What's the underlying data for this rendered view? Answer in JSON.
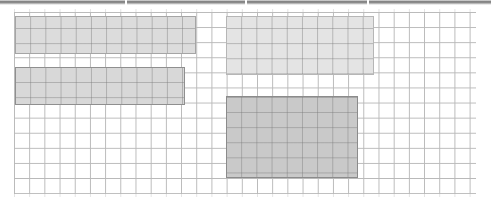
{
  "window": {
    "width": 491,
    "height": 207,
    "background_color": "#ffffff"
  },
  "toolbar_strip": {
    "name": "cropped-toolbar-strip",
    "description": "bottom edge of a cropped toolbar above the canvas",
    "edge_color": "#7c7c7c",
    "divider_positions": [
      125,
      245,
      367
    ]
  },
  "canvas": {
    "name": "grid-canvas",
    "grid_line_color": "#b9b9b9",
    "cell_width": 15.2,
    "cell_height": 15.1,
    "columns": 30,
    "rows": 12,
    "left": 14,
    "top": 12,
    "width": 462,
    "height": 182
  },
  "blocks": [
    {
      "id": "top-left",
      "label": "top-left-block",
      "fill_color": "#dcdcdc",
      "border_color": "#a5a5a5",
      "x": 15,
      "y": 16,
      "width": 181,
      "height": 38,
      "cells_wide": 12,
      "cells_tall": 3
    },
    {
      "id": "bottom-left",
      "label": "bottom-left-block",
      "fill_color": "#d8d8d8",
      "border_color": "#8f8f8f",
      "x": 15,
      "y": 67,
      "width": 170,
      "height": 38,
      "cells_wide": 11,
      "cells_tall": 3
    },
    {
      "id": "top-right",
      "label": "top-right-block",
      "fill_color": "#e4e4e4",
      "border_color": "#b6b6b6",
      "x": 226,
      "y": 16,
      "width": 148,
      "height": 59,
      "cells_wide": 10,
      "cells_tall": 4
    },
    {
      "id": "bottom-right",
      "label": "bottom-right-block",
      "fill_color": "#c9c9c9",
      "border_color": "#8b8b8b",
      "x": 226,
      "y": 96,
      "width": 132,
      "height": 82,
      "cells_wide": 9,
      "cells_tall": 5
    }
  ]
}
